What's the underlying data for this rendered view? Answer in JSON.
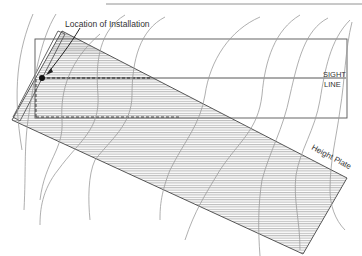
{
  "diagram": {
    "labels": {
      "installation": "Location of Installation",
      "sight_line_1": "SIGHT",
      "sight_line_2": "LINE",
      "height_plate": "Height Plate"
    },
    "colors": {
      "line": "#555555",
      "hatch": "#8a8a8a",
      "contour": "#9a9a9a",
      "text": "#333333",
      "marker": "#111111"
    },
    "elements": [
      "top-rule",
      "sight-frame",
      "sight-line",
      "dashed-reference-line",
      "height-plate-band",
      "installation-marker",
      "contour-lines",
      "installation-bar"
    ]
  }
}
